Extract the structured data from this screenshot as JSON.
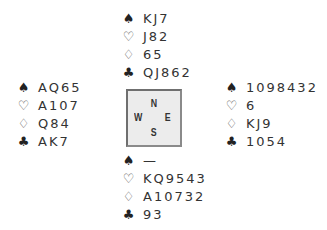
{
  "hands": {
    "north": {
      "spades": "KJ7",
      "hearts": "J82",
      "diamonds": "65",
      "clubs": "QJ862"
    },
    "west": {
      "spades": "AQ65",
      "hearts": "A107",
      "diamonds": "Q84",
      "clubs": "AK7"
    },
    "east": {
      "spades": "1098432",
      "hearts": "6",
      "diamonds": "KJ9",
      "clubs": "1054"
    },
    "south": {
      "spades": "—",
      "hearts": "KQ9543",
      "diamonds": "A10732",
      "clubs": "93"
    }
  },
  "suits": {
    "spades": "♠",
    "hearts": "♡",
    "diamonds": "♢",
    "clubs": "♣"
  },
  "compass": {
    "n": "N",
    "w": "W",
    "e": "E",
    "s": "S"
  }
}
